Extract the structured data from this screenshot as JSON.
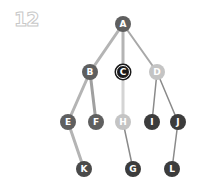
{
  "problem_number": "12",
  "colors": {
    "edge_light": "#c8c8c8",
    "edge_mid": "#a8a8a8",
    "edge_dark": "#8a8a8a",
    "node_mid": "#5f5f5f",
    "node_light": "#c4c4c4",
    "node_dark": "#3c3c3c",
    "node_highlight": "#1a1a1a"
  },
  "nodes": [
    {
      "id": "A",
      "label": "A",
      "x": 123,
      "y": 24,
      "fill": "#5f5f5f",
      "highlight": false
    },
    {
      "id": "B",
      "label": "B",
      "x": 90,
      "y": 72,
      "fill": "#5f5f5f",
      "highlight": false
    },
    {
      "id": "C",
      "label": "C",
      "x": 123,
      "y": 72,
      "fill": "#1a1a1a",
      "highlight": true
    },
    {
      "id": "D",
      "label": "D",
      "x": 157,
      "y": 72,
      "fill": "#c4c4c4",
      "highlight": false
    },
    {
      "id": "E",
      "label": "E",
      "x": 68,
      "y": 122,
      "fill": "#5f5f5f",
      "highlight": false
    },
    {
      "id": "F",
      "label": "F",
      "x": 96,
      "y": 122,
      "fill": "#5f5f5f",
      "highlight": false
    },
    {
      "id": "H",
      "label": "H",
      "x": 123,
      "y": 122,
      "fill": "#c4c4c4",
      "highlight": false
    },
    {
      "id": "I",
      "label": "I",
      "x": 152,
      "y": 122,
      "fill": "#3c3c3c",
      "highlight": false
    },
    {
      "id": "J",
      "label": "J",
      "x": 178,
      "y": 122,
      "fill": "#3c3c3c",
      "highlight": false
    },
    {
      "id": "K",
      "label": "K",
      "x": 84,
      "y": 169,
      "fill": "#4a4a4a",
      "highlight": false
    },
    {
      "id": "G",
      "label": "G",
      "x": 133,
      "y": 169,
      "fill": "#3c3c3c",
      "highlight": false
    },
    {
      "id": "L",
      "label": "L",
      "x": 172,
      "y": 169,
      "fill": "#3c3c3c",
      "highlight": false
    }
  ],
  "edges": [
    {
      "from": "A",
      "to": "B",
      "color": "#b4b4b4",
      "width": 3
    },
    {
      "from": "A",
      "to": "C",
      "color": "#b4b4b4",
      "width": 3
    },
    {
      "from": "A",
      "to": "D",
      "color": "#a8a8a8",
      "width": 2
    },
    {
      "from": "B",
      "to": "E",
      "color": "#b4b4b4",
      "width": 3
    },
    {
      "from": "B",
      "to": "F",
      "color": "#a0a0a0",
      "width": 3
    },
    {
      "from": "C",
      "to": "H",
      "color": "#d4d4d4",
      "width": 3
    },
    {
      "from": "D",
      "to": "I",
      "color": "#8a8a8a",
      "width": 1.5
    },
    {
      "from": "D",
      "to": "J",
      "color": "#8a8a8a",
      "width": 1.5
    },
    {
      "from": "E",
      "to": "K",
      "color": "#b4b4b4",
      "width": 3
    },
    {
      "from": "H",
      "to": "G",
      "color": "#8a8a8a",
      "width": 1.5
    },
    {
      "from": "J",
      "to": "L",
      "color": "#8a8a8a",
      "width": 1.5
    }
  ]
}
